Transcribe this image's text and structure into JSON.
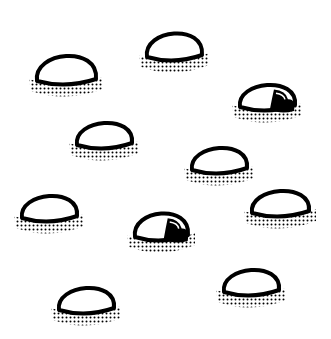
{
  "game": {
    "type": "whack-a-mole board",
    "background": "#ffffff",
    "stroke_color": "#000000",
    "hole_count": 10,
    "holes": [
      {
        "id": 1,
        "x": 35,
        "y": 47,
        "w": 62,
        "h": 40,
        "occupied": false
      },
      {
        "id": 2,
        "x": 145,
        "y": 25,
        "w": 58,
        "h": 38,
        "occupied": false
      },
      {
        "id": 3,
        "x": 238,
        "y": 77,
        "w": 58,
        "h": 36,
        "occupied": true
      },
      {
        "id": 4,
        "x": 75,
        "y": 115,
        "w": 58,
        "h": 36,
        "occupied": false
      },
      {
        "id": 5,
        "x": 190,
        "y": 140,
        "w": 58,
        "h": 36,
        "occupied": false
      },
      {
        "id": 6,
        "x": 20,
        "y": 188,
        "w": 58,
        "h": 36,
        "occupied": false
      },
      {
        "id": 7,
        "x": 133,
        "y": 205,
        "w": 56,
        "h": 38,
        "occupied": true
      },
      {
        "id": 8,
        "x": 250,
        "y": 183,
        "w": 60,
        "h": 36,
        "occupied": false
      },
      {
        "id": 9,
        "x": 57,
        "y": 280,
        "w": 58,
        "h": 36,
        "occupied": false
      },
      {
        "id": 10,
        "x": 222,
        "y": 262,
        "w": 58,
        "h": 36,
        "occupied": false
      }
    ]
  }
}
